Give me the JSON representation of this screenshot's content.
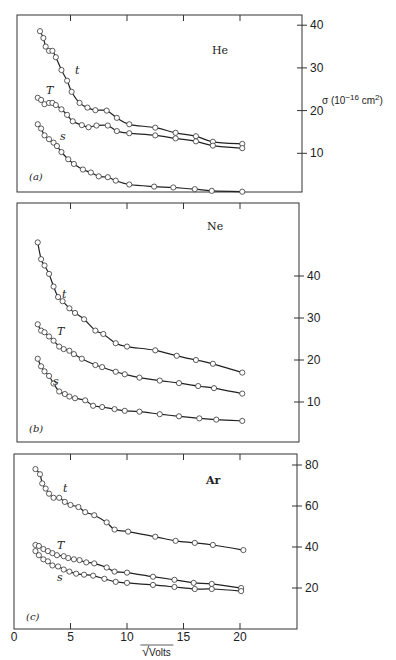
{
  "chart_data": [
    {
      "type": "line",
      "panel": "(a)",
      "gas": "He",
      "ylabel": "σ (10⁻¹⁶ cm²)",
      "yticks": [
        10,
        20,
        30,
        40
      ],
      "ylim": [
        0,
        42
      ],
      "xlim": [
        0,
        25
      ],
      "xticks": [
        5,
        10,
        15,
        20
      ],
      "series": [
        {
          "name": "t",
          "x": [
            2.3,
            2.6,
            2.8,
            3.1,
            3.4,
            3.7,
            4.2,
            4.7,
            5.1,
            5.8,
            6.5,
            7.2,
            8.2,
            9.1,
            10.2,
            12.5,
            14.3,
            16.1,
            17.6,
            20.2
          ],
          "y": [
            38.6,
            37,
            35,
            34,
            34,
            32.5,
            29.5,
            27,
            24.4,
            21.8,
            20.7,
            20.1,
            20,
            18.3,
            16.8,
            16,
            14.8,
            14,
            12.7,
            12.2
          ]
        },
        {
          "name": "T",
          "x": [
            2.1,
            2.4,
            2.7,
            3.1,
            3.4,
            3.7,
            4.2,
            4.7,
            5.2,
            6.0,
            6.6,
            7.3,
            8.3,
            9.1,
            10.2,
            12.5,
            14.3,
            16.1,
            17.6,
            20.2
          ],
          "y": [
            23,
            22.5,
            21.5,
            21.8,
            21.8,
            21.3,
            20.3,
            19,
            17.5,
            16.6,
            16.1,
            16.5,
            16.5,
            15.2,
            14.7,
            14.2,
            13.5,
            12.8,
            11.8,
            11.2
          ]
        },
        {
          "name": "s",
          "x": [
            2.1,
            2.4,
            2.7,
            3.1,
            3.5,
            3.8,
            4.2,
            4.8,
            5.3,
            6.1,
            6.8,
            7.5,
            8.3,
            9.0,
            10.2,
            12.4,
            14.1,
            16.0,
            17.5,
            20.2
          ],
          "y": [
            16.8,
            15.8,
            14.2,
            13.3,
            12.5,
            11.7,
            10.3,
            8.6,
            7.5,
            6.2,
            5.5,
            4.6,
            4.4,
            3.6,
            2.7,
            2.2,
            2.0,
            1.6,
            1.2,
            1.0
          ]
        }
      ]
    },
    {
      "type": "line",
      "panel": "(b)",
      "gas": "Ne",
      "yticks": [
        10,
        20,
        30,
        40
      ],
      "ylim": [
        0,
        57
      ],
      "xlim": [
        0,
        25
      ],
      "xticks": [
        5,
        10,
        15,
        20
      ],
      "series": [
        {
          "name": "t",
          "x": [
            2.1,
            2.4,
            2.7,
            3.1,
            3.5,
            3.9,
            4.3,
            4.9,
            5.4,
            6.2,
            7.2,
            7.9,
            9.0,
            10.0,
            12.5,
            14.4,
            16.1,
            17.6,
            20.2
          ],
          "y": [
            48,
            44,
            42.5,
            40.5,
            37.5,
            35,
            34,
            32.3,
            31.2,
            29.7,
            27,
            26.2,
            24,
            23.2,
            22.3,
            21,
            20,
            19.1,
            17
          ]
        },
        {
          "name": "T",
          "x": [
            2.1,
            2.4,
            2.7,
            3.1,
            3.5,
            4.0,
            4.4,
            4.9,
            5.3,
            6.0,
            7.2,
            7.8,
            9.0,
            9.8,
            11.1,
            12.9,
            14.6,
            16.3,
            17.7,
            20.2
          ],
          "y": [
            28.5,
            27,
            26.6,
            25.6,
            24.6,
            23.2,
            22.6,
            22.2,
            21.4,
            20.3,
            18.8,
            18.3,
            17.2,
            16.6,
            15.8,
            15.1,
            14.5,
            13.8,
            13.3,
            12
          ]
        },
        {
          "name": "s",
          "x": [
            2.1,
            2.4,
            2.7,
            3.1,
            3.5,
            4.0,
            4.5,
            4.9,
            5.4,
            6.3,
            7.0,
            7.8,
            8.9,
            9.8,
            11.1,
            12.9,
            14.6,
            16.4,
            17.9,
            20.2
          ],
          "y": [
            20.3,
            18.5,
            17.3,
            16.2,
            14.4,
            12.5,
            11.9,
            11.3,
            10.9,
            10.4,
            9.1,
            8.8,
            8.3,
            7.9,
            7.7,
            7.1,
            6.6,
            6.1,
            5.8,
            5.5
          ]
        }
      ]
    },
    {
      "type": "line",
      "panel": "(c)",
      "gas": "Ar",
      "yticks": [
        20,
        40,
        60,
        80
      ],
      "ylim": [
        0,
        85
      ],
      "xlim": [
        0,
        25
      ],
      "xticks": [
        0,
        5,
        10,
        15,
        20
      ],
      "xlabel": "√Volts",
      "series": [
        {
          "name": "t",
          "x": [
            1.9,
            2.3,
            2.5,
            2.8,
            3.1,
            3.5,
            4.0,
            4.5,
            5.0,
            5.7,
            6.3,
            7.1,
            8.2,
            8.9,
            10.1,
            12.5,
            14.3,
            16.0,
            17.6,
            20.3
          ],
          "y": [
            78,
            75.5,
            71,
            68.5,
            66,
            64,
            64,
            62,
            60.5,
            59.5,
            57,
            55.5,
            52,
            48.5,
            47.5,
            45,
            43,
            42,
            41,
            38.5
          ]
        },
        {
          "name": "T",
          "x": [
            1.9,
            2.2,
            2.6,
            3.0,
            3.4,
            3.8,
            4.4,
            4.8,
            5.3,
            5.8,
            6.4,
            7.1,
            8.2,
            8.9,
            10.0,
            12.3,
            14.2,
            15.9,
            17.5,
            20.1
          ],
          "y": [
            41,
            40.5,
            39,
            38,
            37,
            36,
            35.5,
            34.6,
            34,
            33.6,
            32.5,
            32,
            30,
            28,
            27.5,
            25.5,
            24,
            22.5,
            22,
            20
          ]
        },
        {
          "name": "s",
          "x": [
            1.9,
            2.2,
            2.6,
            3.0,
            3.4,
            3.9,
            4.4,
            4.9,
            5.5,
            6.2,
            7.0,
            8.0,
            9.0,
            10.0,
            12.3,
            14.2,
            16.0,
            17.5,
            20.1
          ],
          "y": [
            38,
            36,
            34,
            33,
            31,
            30.5,
            29,
            28,
            27,
            26.5,
            26,
            24.5,
            23,
            22.5,
            21.5,
            20.5,
            19.5,
            19.5,
            18.5
          ]
        }
      ]
    }
  ],
  "labels": {
    "ylabel": "σ (10",
    "ylabel_exp": "−16",
    "ylabel_unit": " cm",
    "ylabel_unit_exp": "2",
    "ylabel_close": ")",
    "xlabel_root": "√",
    "xlabel": "Volts",
    "x_tick_labels": [
      "0",
      "5",
      "10",
      "15",
      "20"
    ]
  }
}
